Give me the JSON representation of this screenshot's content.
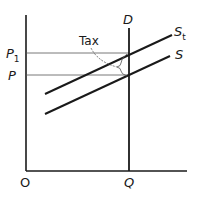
{
  "diagram": {
    "colors": {
      "background": "#ffffff",
      "ink": "#1a1a1a",
      "thin_line": "#555555"
    },
    "axes": {
      "origin_label": "O",
      "x_tick_label": "Q",
      "y_tick_labels": [
        "P",
        "P1"
      ]
    },
    "curves": {
      "demand": {
        "label": "D",
        "type": "vertical"
      },
      "supply": {
        "label": "S",
        "type": "upward-sloping"
      },
      "supply_with_tax": {
        "label": "S",
        "subscript": "t",
        "type": "upward-sloping"
      }
    },
    "annotations": {
      "tax_label": "Tax"
    },
    "price_levels": {
      "P": {
        "label": "P"
      },
      "P1": {
        "label": "P",
        "subscript": "1"
      }
    }
  }
}
